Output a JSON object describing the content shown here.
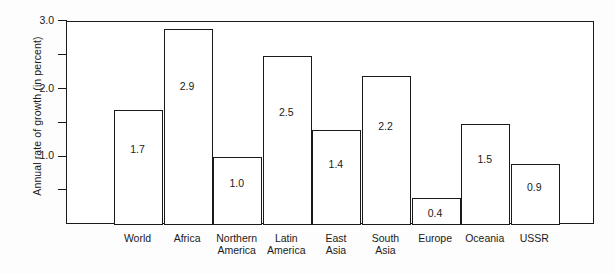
{
  "chart_data": {
    "type": "bar",
    "title": "",
    "subtitle": "",
    "xlabel": "",
    "ylabel": "Annual rate of  growth (in percent)",
    "ylim": [
      0,
      3.0
    ],
    "y_ticks_major": [
      "1.0",
      "2.0",
      "3.0"
    ],
    "y_ticks_major_values": [
      1.0,
      2.0,
      3.0
    ],
    "y_ticks_minor_values": [
      0.5,
      1.5,
      2.5
    ],
    "grid": false,
    "legend": "none",
    "bar_style": "white fill with black outline",
    "categories": [
      "World",
      "Africa",
      "Northern America",
      "Latin America",
      "East Asia",
      "South Asia",
      "Europe",
      "Oceania",
      "USSR"
    ],
    "category_lines": [
      [
        "World"
      ],
      [
        "Africa"
      ],
      [
        "Northern",
        "America"
      ],
      [
        "Latin",
        "America"
      ],
      [
        "East",
        "Asia"
      ],
      [
        "South",
        "Asia"
      ],
      [
        "Europe"
      ],
      [
        "Oceania"
      ],
      [
        "USSR"
      ]
    ],
    "values": [
      1.7,
      2.9,
      1.0,
      2.5,
      1.4,
      2.2,
      0.4,
      1.5,
      0.9
    ],
    "value_labels": [
      "1.7",
      "2.9",
      "1.0",
      "2.5",
      "1.4",
      "2.2",
      "0.4",
      "1.5",
      "0.9"
    ]
  },
  "colors": {
    "ink": "#1a1a1a",
    "bar_fill": "#ffffff",
    "background": "#fdfdfd"
  }
}
